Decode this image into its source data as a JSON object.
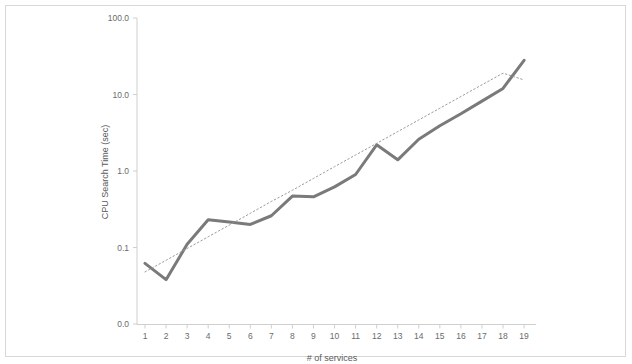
{
  "chart_data": {
    "type": "line",
    "title": "",
    "xlabel": "# of services",
    "ylabel": "CPU Search Time (sec)",
    "yscale": "log",
    "grid": false,
    "legend": "none",
    "x": [
      1,
      2,
      3,
      4,
      5,
      6,
      7,
      8,
      9,
      10,
      11,
      12,
      13,
      14,
      15,
      16,
      17,
      18,
      19
    ],
    "xtick_labels": [
      "1",
      "2",
      "3",
      "4",
      "5",
      "6",
      "7",
      "8",
      "9",
      "10",
      "11",
      "12",
      "13",
      "14",
      "15",
      "16",
      "17",
      "18",
      "19"
    ],
    "ytick_labels": [
      "100.0",
      "10.0",
      "1.0",
      "0.1",
      "0.0"
    ],
    "ytick_values": [
      100.0,
      10.0,
      1.0,
      0.1,
      0.01
    ],
    "ylim": [
      0.01,
      100.0
    ],
    "xlim": [
      0.5,
      19.5
    ],
    "series": [
      {
        "name": "CPU Search Time",
        "style": "solid",
        "color": "#7a7a7a",
        "width": 3,
        "values": [
          0.062,
          0.038,
          0.11,
          0.23,
          0.215,
          0.2,
          0.26,
          0.47,
          0.46,
          0.62,
          0.9,
          2.2,
          1.4,
          2.6,
          3.9,
          5.6,
          8.2,
          12.0,
          28.0
        ]
      },
      {
        "name": "Trendline",
        "style": "dotted",
        "color": "#9a9a9a",
        "width": 1,
        "values": [
          0.048,
          0.068,
          0.097,
          0.138,
          0.196,
          0.28,
          0.4,
          0.56,
          0.8,
          1.14,
          1.62,
          2.3,
          3.27,
          4.65,
          6.62,
          9.41,
          13.4,
          19.0,
          15.5
        ]
      }
    ]
  },
  "axis": {
    "x_title": "# of services",
    "y_title": "CPU Search Time (sec)"
  },
  "colors": {
    "series_line": "#7a7a7a",
    "trendline": "#9a9a9a",
    "axis": "#cfcfcf",
    "tick_text": "#6b6b6b",
    "frame": "#d8d8d8",
    "background": "#ffffff"
  }
}
